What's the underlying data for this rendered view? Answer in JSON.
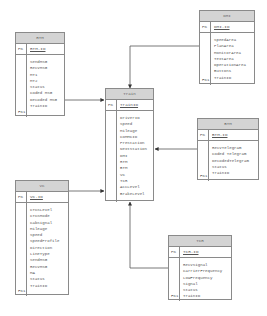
{
  "entities": {
    "rtm": {
      "title": "RTM",
      "pk_label": "PK",
      "pk": "RTM.ID",
      "fk_label": "FK1",
      "fields": [
        "SendMSG",
        "RecvMSG",
        "MT1",
        "MT2",
        "Status",
        "Coded MSG",
        "Decoded MSG",
        "TrainID"
      ]
    },
    "dmi": {
      "title": "DMI",
      "pk_label": "PK",
      "pk": "DMI.ID",
      "fk_label": "FK1",
      "fields": [
        "SpeedArea",
        "PlanArea",
        "MonitorArea",
        "TextArea",
        "OperationArea",
        "Buttons",
        "TrainID"
      ]
    },
    "train": {
      "title": "Train",
      "pk_label": "PK",
      "pk": "TrainID",
      "fields": [
        "DriverID",
        "Speed",
        "Mileage",
        "CoMMCID",
        "PreStation",
        "NextStation",
        "DMI",
        "RTM",
        "BTM",
        "VC",
        "TCR",
        "AccLevel",
        "BrakeLevel"
      ]
    },
    "btm": {
      "title": "BTM",
      "pk_label": "PK",
      "pk": "BTM.ID",
      "fk_label": "FK1",
      "fields": [
        "RecvTelegram",
        "Coded Telegram",
        "DecodedTelegram",
        "Status",
        "TrainID"
      ]
    },
    "vc": {
      "title": "VC",
      "pk_label": "PK",
      "pk": "VC.ID",
      "fk_label": "FK1",
      "fields": [
        "CTCSLevel",
        "CTCSMode",
        "CabSignal",
        "Mileage",
        "Speed",
        "SpeedProfile",
        "Direction",
        "LineType",
        "SendMSG",
        "RecvMSG",
        "MA",
        "Status",
        "TrainID"
      ]
    },
    "tcr": {
      "title": "TCR",
      "pk_label": "PK",
      "pk": "TCR.ID",
      "fk_label": "FK1",
      "fields": [
        "RecvSignal",
        "CarrierFrequency",
        "LowFrequency",
        "Signal",
        "Status",
        "TrainID"
      ]
    }
  },
  "colors": {
    "header": "#d4d4d4",
    "border": "#8a8a8a",
    "line": "#444444"
  }
}
